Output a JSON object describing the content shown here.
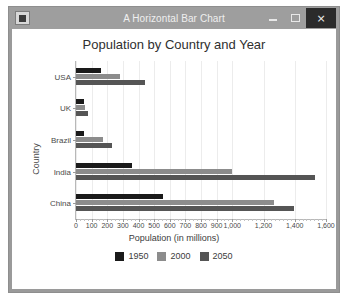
{
  "window": {
    "title": "A Horizontal Bar Chart",
    "icon": "app-icon",
    "minimize_label": "–",
    "maximize_label": "□",
    "close_label": "×"
  },
  "chart_data": {
    "type": "bar",
    "orientation": "horizontal",
    "title": "Population by Country and Year",
    "xlabel": "Population (in millions)",
    "ylabel": "Country",
    "categories": [
      "China",
      "India",
      "Brazil",
      "UK",
      "USA"
    ],
    "categories_top_to_bottom": [
      "USA",
      "UK",
      "Brazil",
      "India",
      "China"
    ],
    "series": [
      {
        "name": "1950",
        "color": "#1a1a1a",
        "values": [
          554,
          357,
          54,
          50,
          158
        ]
      },
      {
        "name": "2000",
        "color": "#8c8c8c",
        "values": [
          1270,
          1000,
          172,
          59,
          282
        ]
      },
      {
        "name": "2050",
        "color": "#555555",
        "values": [
          1395,
          1531,
          233,
          75,
          439
        ]
      }
    ],
    "xlim": [
      0,
      1600
    ],
    "ylim_note": "categorical",
    "xticks": [
      0,
      100,
      200,
      300,
      400,
      500,
      600,
      700,
      800,
      900,
      1000,
      1200,
      1400,
      1600
    ],
    "xtick_labels": [
      "0",
      "100",
      "200",
      "300",
      "400",
      "500",
      "600",
      "700",
      "800",
      "900",
      "1,000",
      "1,200",
      "1,400",
      "1,600"
    ],
    "grid": true,
    "legend_position": "bottom",
    "legend": [
      "1950",
      "2000",
      "2050"
    ]
  }
}
